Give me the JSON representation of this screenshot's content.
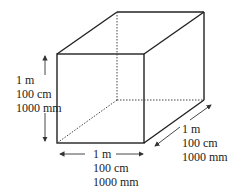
{
  "diagram": {
    "height_labels": [
      "1 m",
      "100 cm",
      "1000 mm"
    ],
    "width_labels": [
      "1 m",
      "100 cm",
      "1000 mm"
    ],
    "depth_labels": [
      "1 m",
      "100 cm",
      "1000 mm"
    ]
  }
}
